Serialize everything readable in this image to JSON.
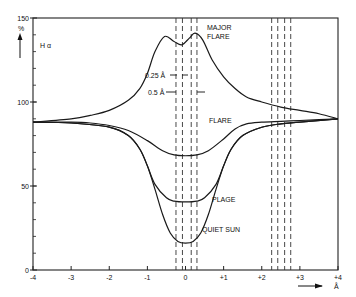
{
  "chart_data": {
    "type": "line",
    "title": "H α",
    "xlabel": "Å",
    "ylabel": "%",
    "xlim": [
      -4,
      4
    ],
    "ylim": [
      0,
      150
    ],
    "x_ticks": [
      -4,
      -3,
      -2,
      -1,
      0,
      1,
      2,
      3,
      4
    ],
    "x_tick_labels": [
      "-4",
      "-3",
      "-2",
      "-1",
      "0",
      "+1",
      "+2",
      "+3",
      "+4"
    ],
    "y_ticks": [
      0,
      50,
      100,
      150
    ],
    "y_tick_labels": [
      "0",
      "50",
      "100",
      "150"
    ],
    "grid": false,
    "series": [
      {
        "name": "MAJOR FLARE",
        "label": [
          "MAJOR",
          "FLARE"
        ],
        "x": [
          -4,
          -3,
          -2.5,
          -2,
          -1.5,
          -1.2,
          -1,
          -0.8,
          -0.55,
          -0.3,
          -0.1,
          0.1,
          0.25,
          0.45,
          0.7,
          1,
          1.3,
          1.6,
          2,
          2.5,
          3,
          3.5,
          4
        ],
        "y": [
          88,
          90,
          92,
          95,
          101,
          108,
          117,
          130,
          139,
          136,
          134,
          138,
          141,
          137,
          125,
          115,
          108,
          103,
          100,
          97,
          95,
          93,
          90
        ]
      },
      {
        "name": "FLARE",
        "label": [
          "FLARE"
        ],
        "x": [
          -4,
          -3,
          -2.5,
          -2,
          -1.5,
          -1,
          -0.6,
          -0.3,
          0,
          0.3,
          0.6,
          1,
          1.3,
          1.6,
          2,
          2.5,
          3,
          3.5,
          4
        ],
        "y": [
          88,
          88,
          87.5,
          86,
          83,
          77,
          71,
          68.5,
          68,
          68.5,
          71,
          78,
          84,
          87,
          88,
          88.5,
          89,
          89.5,
          90
        ]
      },
      {
        "name": "PLAGE",
        "label": [
          "PLAGE"
        ],
        "x": [
          -4,
          -3,
          -2,
          -1.5,
          -1.2,
          -1,
          -0.8,
          -0.5,
          -0.3,
          0,
          0.3,
          0.5,
          0.8,
          1,
          1.2,
          1.5,
          2,
          2.5,
          3,
          4
        ],
        "y": [
          88,
          87.5,
          85,
          80,
          72,
          62,
          51,
          43,
          41,
          40.5,
          41,
          43,
          51,
          62,
          72,
          80,
          85,
          87,
          88,
          90
        ]
      },
      {
        "name": "QUIET SUN",
        "label": [
          "QUIET SUN"
        ],
        "x": [
          -4,
          -3,
          -2,
          -1.5,
          -1.2,
          -1,
          -0.8,
          -0.6,
          -0.4,
          -0.2,
          0,
          0.2,
          0.4,
          0.6,
          0.8,
          1,
          1.2,
          1.5,
          2,
          2.5,
          3,
          4
        ],
        "y": [
          88,
          87.5,
          85,
          80,
          72,
          62,
          48,
          33,
          22,
          17,
          16,
          17,
          22,
          33,
          48,
          62,
          72,
          80,
          85,
          87,
          88,
          90
        ]
      }
    ],
    "vertical_dashed_lines_x": [
      -0.25,
      -0.08,
      0.15,
      0.3,
      2.26,
      2.42,
      2.6,
      2.76
    ],
    "annotations": [
      {
        "text": "0.25 Å",
        "note": "bandwidth marker"
      },
      {
        "text": "0.5 Å",
        "note": "bandwidth marker"
      }
    ],
    "ylabel_arrow": "up",
    "xlabel_arrow": "right"
  }
}
